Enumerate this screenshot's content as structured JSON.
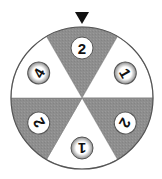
{
  "spinner": {
    "center": [
      82,
      98
    ],
    "radius": 71,
    "pointer": {
      "icon": "down-triangle-pointer",
      "color": "#111111"
    },
    "colors": {
      "shaded": "#8e8e8e",
      "unshaded": "#ffffff",
      "outline": "#555555"
    },
    "sectors": [
      {
        "position": "top",
        "label": "2",
        "shaded": true,
        "rotation": 0
      },
      {
        "position": "upper-right",
        "label": "1",
        "shaded": false,
        "rotation": 60
      },
      {
        "position": "lower-right",
        "label": "2",
        "shaded": true,
        "rotation": 120
      },
      {
        "position": "bottom",
        "label": "1",
        "shaded": false,
        "rotation": 180
      },
      {
        "position": "lower-left",
        "label": "2",
        "shaded": true,
        "rotation": 240
      },
      {
        "position": "upper-left",
        "label": "4",
        "shaded": false,
        "rotation": 300
      }
    ]
  }
}
